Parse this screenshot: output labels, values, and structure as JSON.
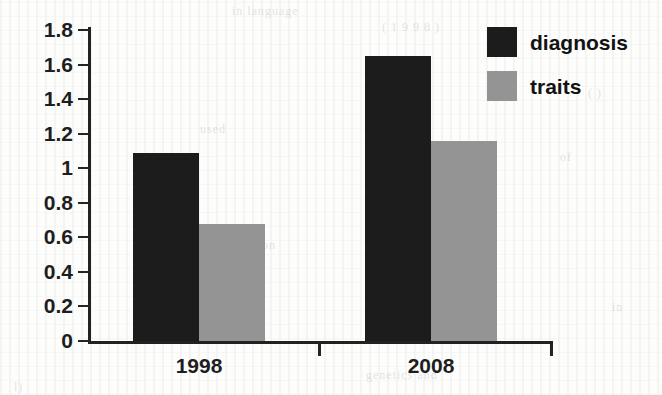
{
  "chart_data": {
    "type": "bar",
    "title": "",
    "xlabel": "",
    "ylabel": "",
    "categories": [
      "1998",
      "2008"
    ],
    "series": [
      {
        "name": "diagnosis",
        "color": "#1c1c1c",
        "values": [
          1.09,
          1.65
        ]
      },
      {
        "name": "traits",
        "color": "#949494",
        "values": [
          0.68,
          1.16
        ]
      }
    ],
    "ylim": [
      0,
      1.8
    ],
    "yticks": [
      0,
      0.2,
      0.4,
      0.6,
      0.8,
      1,
      1.2,
      1.4,
      1.6,
      1.8
    ],
    "ytick_labels": [
      "0",
      "0.2",
      "0.4",
      "0.6",
      "0.8",
      "1",
      "1.2",
      "1.4",
      "1.6",
      "1.8"
    ],
    "grid": false,
    "legend_position": "top-right"
  },
  "legend": {
    "entries": [
      {
        "label": "diagnosis",
        "color": "#1c1c1c"
      },
      {
        "label": "traits",
        "color": "#949494"
      }
    ]
  },
  "axes": {
    "y_labels": [
      "1.8",
      "1.6",
      "1.4",
      "1.2",
      "1",
      "0.8",
      "0.6",
      "0.4",
      "0.2",
      "0"
    ],
    "x_labels": [
      "1998",
      "2008"
    ]
  },
  "colors": {
    "diagnosis": "#1c1c1c",
    "traits": "#949494",
    "axis": "#222222",
    "background": "#fdfdfc"
  },
  "background_artifacts": [
    {
      "text": "in language",
      "x": 232,
      "y": 4
    },
    {
      "text": "( 1 9 9 8 )",
      "x": 382,
      "y": 20
    },
    {
      "text": "of the",
      "x": 398,
      "y": 58
    },
    {
      "text": "( )",
      "x": 588,
      "y": 86
    },
    {
      "text": "used",
      "x": 200,
      "y": 122
    },
    {
      "text": "of",
      "x": 560,
      "y": 150
    },
    {
      "text": "on",
      "x": 262,
      "y": 238
    },
    {
      "text": "in",
      "x": 612,
      "y": 300
    },
    {
      "text": "genetics and",
      "x": 366,
      "y": 368
    },
    {
      "text": "l)",
      "x": 14,
      "y": 380
    }
  ]
}
